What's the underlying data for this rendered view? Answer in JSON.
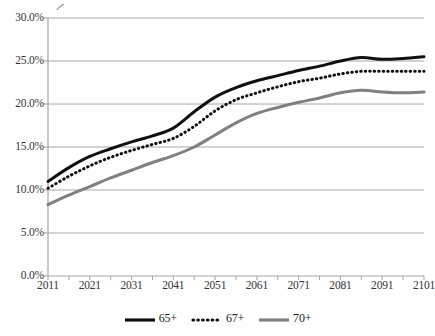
{
  "chart_data": {
    "type": "line",
    "title": "",
    "xlabel": "",
    "ylabel": "",
    "xlim": [
      2011,
      2101
    ],
    "ylim": [
      0.0,
      30.0
    ],
    "y_unit": "%",
    "grid": true,
    "legend_position": "bottom-center",
    "x_tick_labels": [
      "2011",
      "2021",
      "2031",
      "2041",
      "2051",
      "2061",
      "2071",
      "2081",
      "2091",
      "2101"
    ],
    "y_tick_labels": [
      "0.0%",
      "5.0%",
      "10.0%",
      "15.0%",
      "20.0%",
      "25.0%",
      "30.0%"
    ],
    "y_tick_values": [
      0.0,
      5.0,
      10.0,
      15.0,
      20.0,
      25.0,
      30.0
    ],
    "x": [
      2011,
      2016,
      2021,
      2026,
      2031,
      2036,
      2041,
      2046,
      2051,
      2056,
      2061,
      2066,
      2071,
      2076,
      2081,
      2086,
      2091,
      2096,
      2101
    ],
    "series": [
      {
        "name": "65+",
        "style": "solid",
        "color": "#101010",
        "width": 3.0,
        "values": [
          11.0,
          12.6,
          13.9,
          14.8,
          15.6,
          16.3,
          17.2,
          19.1,
          20.8,
          21.9,
          22.7,
          23.3,
          23.9,
          24.4,
          25.0,
          25.4,
          25.2,
          25.3,
          25.5
        ]
      },
      {
        "name": "67+",
        "style": "dotted",
        "color": "#101010",
        "width": 3.0,
        "values": [
          10.2,
          11.6,
          12.8,
          13.8,
          14.6,
          15.3,
          16.0,
          17.4,
          19.2,
          20.5,
          21.3,
          22.0,
          22.6,
          23.0,
          23.5,
          23.8,
          23.8,
          23.8,
          23.8
        ]
      },
      {
        "name": "70+",
        "style": "solid",
        "color": "#808080",
        "width": 3.0,
        "values": [
          8.3,
          9.4,
          10.4,
          11.4,
          12.3,
          13.2,
          14.0,
          15.0,
          16.4,
          17.8,
          18.9,
          19.6,
          20.2,
          20.7,
          21.3,
          21.6,
          21.4,
          21.3,
          21.4
        ]
      }
    ]
  },
  "legend": {
    "items": [
      {
        "label": "65+"
      },
      {
        "label": "67+"
      },
      {
        "label": "70+"
      }
    ]
  },
  "colors": {
    "series_65": "#101010",
    "series_67": "#101010",
    "series_70": "#808080",
    "grid": "#a6a6a6",
    "axis": "#a6a6a6",
    "text": "#333333",
    "background": "#ffffff"
  }
}
